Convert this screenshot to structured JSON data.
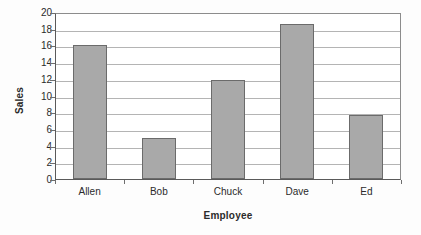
{
  "chart_data": {
    "type": "bar",
    "title": "",
    "subtitle": "",
    "xlabel": "Employee",
    "ylabel": "Sales",
    "categories": [
      "Allen",
      "Bob",
      "Chuck",
      "Dave",
      "Ed"
    ],
    "values": [
      16.0,
      4.9,
      11.9,
      18.6,
      7.7
    ],
    "series": [
      {
        "name": "Sales",
        "values": [
          16.0,
          4.9,
          11.9,
          18.6,
          7.7
        ]
      }
    ],
    "ylim": [
      0,
      20
    ],
    "ytick_step": 2,
    "yticks": [
      20,
      18,
      16,
      14,
      12,
      10,
      8,
      6,
      4,
      2,
      0
    ],
    "ytick_labels": [
      "20",
      "18",
      "16",
      "14",
      "12",
      "10",
      "8",
      "6",
      "4",
      "2",
      "0"
    ],
    "xticks": [
      "Allen",
      "Bob",
      "Chuck",
      "Dave",
      "Ed"
    ],
    "grid": true,
    "grid_axis": "y",
    "legend": false,
    "legend_position": "none",
    "annotations": [],
    "colors": {
      "bar_fill": "#a9a9a9",
      "bar_border": "#6b6b6b",
      "gridline": "#b4b4b4",
      "axis": "#5a5a5a",
      "text": "#2b2b2b",
      "plot_background": "#ffffff",
      "page_background": "#fdfdfd"
    }
  }
}
